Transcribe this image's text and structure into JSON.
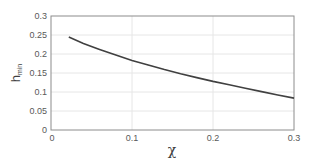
{
  "chart_data": {
    "type": "line",
    "title": "",
    "xlabel": "χ",
    "ylabel": "h_min",
    "xlim": [
      0,
      0.3
    ],
    "ylim": [
      0,
      0.3
    ],
    "x_ticks": [
      "0",
      "0.1",
      "0.2",
      "0.3"
    ],
    "y_ticks": [
      "0",
      "0.05",
      "0.1",
      "0.15",
      "0.2",
      "0.25",
      "0.3"
    ],
    "grid": true,
    "legend": null,
    "series": [
      {
        "name": "h_min",
        "color": "#404040",
        "x": [
          0.022,
          0.04,
          0.06,
          0.08,
          0.1,
          0.12,
          0.14,
          0.16,
          0.18,
          0.2,
          0.22,
          0.24,
          0.26,
          0.28,
          0.3
        ],
        "y": [
          0.245,
          0.228,
          0.212,
          0.197,
          0.183,
          0.171,
          0.159,
          0.148,
          0.138,
          0.128,
          0.119,
          0.11,
          0.101,
          0.092,
          0.084
        ]
      }
    ]
  },
  "labels": {
    "xlabel": "χ",
    "ylabel_main": "h",
    "ylabel_sub": "min",
    "x_ticks": [
      "0",
      "0.1",
      "0.2",
      "0.3"
    ],
    "y_ticks": [
      "0",
      "0.05",
      "0.1",
      "0.15",
      "0.2",
      "0.25",
      "0.3"
    ]
  }
}
